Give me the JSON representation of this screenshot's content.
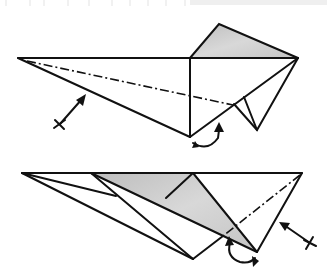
{
  "figure": {
    "type": "origami-folding-diagram",
    "steps": [
      {
        "name": "step-top",
        "symbols": [
          "valley-fold-line",
          "fold-arrow",
          "turn-over-arrow"
        ]
      },
      {
        "name": "step-bottom",
        "symbols": [
          "valley-fold-line",
          "fold-arrow",
          "turn-over-arrow"
        ]
      }
    ],
    "colors": {
      "line": "#111111",
      "shade": "#c8c8c8",
      "background": "#ffffff"
    }
  }
}
